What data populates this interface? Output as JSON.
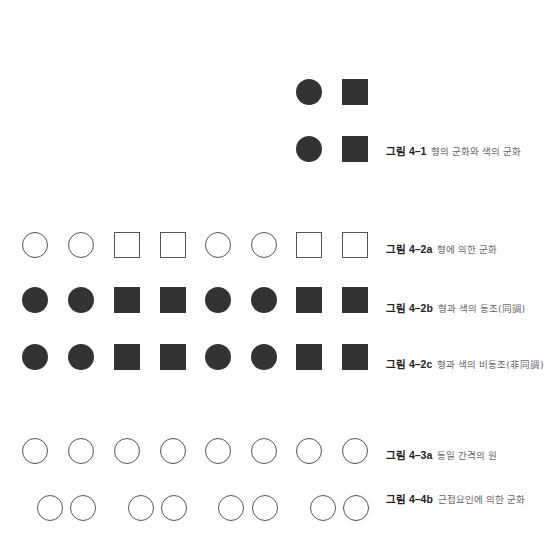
{
  "colors": {
    "fill": "#333333",
    "stroke": "#555555",
    "background": "#ffffff"
  },
  "shape_size": 26,
  "figures": [
    {
      "id": "4-1",
      "label_num": "그림 4–1",
      "label_desc": "형의 군화와 색의 군화",
      "label_y": 151,
      "rows": [
        {
          "y": 92,
          "shapes": [
            {
              "type": "circle",
              "style": "filled",
              "x": 309
            },
            {
              "type": "square",
              "style": "filled",
              "x": 355
            }
          ]
        },
        {
          "y": 149,
          "shapes": [
            {
              "type": "circle",
              "style": "filled",
              "x": 309
            },
            {
              "type": "square",
              "style": "filled",
              "x": 355
            }
          ]
        }
      ]
    },
    {
      "id": "4-2a",
      "label_num": "그림 4–2a",
      "label_desc": "형에 의한 군화",
      "label_y": 249,
      "rows": [
        {
          "y": 245,
          "shapes": [
            {
              "type": "circle",
              "style": "outline",
              "x": 35
            },
            {
              "type": "circle",
              "style": "outline",
              "x": 81
            },
            {
              "type": "square",
              "style": "outline",
              "x": 127
            },
            {
              "type": "square",
              "style": "outline",
              "x": 173
            },
            {
              "type": "circle",
              "style": "outline",
              "x": 218
            },
            {
              "type": "circle",
              "style": "outline",
              "x": 264
            },
            {
              "type": "square",
              "style": "outline",
              "x": 309
            },
            {
              "type": "square",
              "style": "outline",
              "x": 355
            }
          ]
        }
      ]
    },
    {
      "id": "4-2b",
      "label_num": "그림 4–2b",
      "label_desc": "형과 색의 동조(同調)",
      "label_y": 308,
      "rows": [
        {
          "y": 300,
          "shapes": [
            {
              "type": "circle",
              "style": "filled",
              "x": 35
            },
            {
              "type": "circle",
              "style": "filled",
              "x": 81
            },
            {
              "type": "square",
              "style": "filled",
              "x": 127
            },
            {
              "type": "square",
              "style": "filled",
              "x": 173
            },
            {
              "type": "circle",
              "style": "filled",
              "x": 218
            },
            {
              "type": "circle",
              "style": "filled",
              "x": 264
            },
            {
              "type": "square",
              "style": "filled",
              "x": 309
            },
            {
              "type": "square",
              "style": "filled",
              "x": 355
            }
          ]
        }
      ]
    },
    {
      "id": "4-2c",
      "label_num": "그림 4–2c",
      "label_desc": "형과 색의 비동조(非同調)",
      "label_y": 364,
      "rows": [
        {
          "y": 357,
          "shapes": [
            {
              "type": "circle",
              "style": "filled",
              "x": 35
            },
            {
              "type": "circle",
              "style": "filled",
              "x": 81
            },
            {
              "type": "square",
              "style": "filled",
              "x": 127
            },
            {
              "type": "square",
              "style": "filled",
              "x": 173
            },
            {
              "type": "circle",
              "style": "filled",
              "x": 218
            },
            {
              "type": "circle",
              "style": "filled",
              "x": 264
            },
            {
              "type": "square",
              "style": "filled",
              "x": 309
            },
            {
              "type": "square",
              "style": "filled",
              "x": 355
            }
          ]
        }
      ]
    },
    {
      "id": "4-3a",
      "label_num": "그림 4–3a",
      "label_desc": "동일 간격의 원",
      "label_y": 455,
      "rows": [
        {
          "y": 451,
          "shapes": [
            {
              "type": "circle",
              "style": "outline",
              "x": 35
            },
            {
              "type": "circle",
              "style": "outline",
              "x": 81
            },
            {
              "type": "circle",
              "style": "outline",
              "x": 127
            },
            {
              "type": "circle",
              "style": "outline",
              "x": 173
            },
            {
              "type": "circle",
              "style": "outline",
              "x": 218
            },
            {
              "type": "circle",
              "style": "outline",
              "x": 264
            },
            {
              "type": "circle",
              "style": "outline",
              "x": 309
            },
            {
              "type": "circle",
              "style": "outline",
              "x": 355
            }
          ]
        }
      ]
    },
    {
      "id": "4-4b",
      "label_num": "그림 4–4b",
      "label_desc": "근접요인에 의한 군화",
      "label_y": 499,
      "rows": [
        {
          "y": 508,
          "shapes": [
            {
              "type": "circle",
              "style": "outline",
              "x": 50
            },
            {
              "type": "circle",
              "style": "outline",
              "x": 83
            },
            {
              "type": "circle",
              "style": "outline",
              "x": 141
            },
            {
              "type": "circle",
              "style": "outline",
              "x": 174
            },
            {
              "type": "circle",
              "style": "outline",
              "x": 231
            },
            {
              "type": "circle",
              "style": "outline",
              "x": 265
            },
            {
              "type": "circle",
              "style": "outline",
              "x": 323
            },
            {
              "type": "circle",
              "style": "outline",
              "x": 356
            }
          ]
        }
      ]
    }
  ]
}
